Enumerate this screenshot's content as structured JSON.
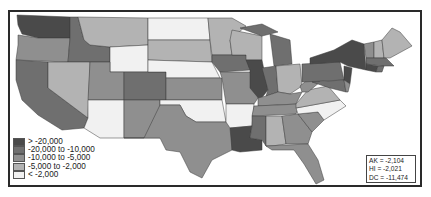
{
  "map": {
    "type": "choropleth",
    "region": "Contiguous United States",
    "colors": {
      "gt_20000": "#4a4a4a",
      "20000_to_10000": "#6f6f6f",
      "10000_to_5000": "#8f8f8f",
      "5000_to_2000": "#b3b3b3",
      "lt_2000": "#f1f1f1",
      "border": "#2a2a2a"
    }
  },
  "legend": {
    "items": [
      {
        "label": "> -20,000",
        "color": "#4a4a4a"
      },
      {
        "label": "-20,000 to -10,000",
        "color": "#6f6f6f"
      },
      {
        "label": "-10,000 to -5,000",
        "color": "#8f8f8f"
      },
      {
        "label": "-5,000 to -2,000",
        "color": "#b3b3b3"
      },
      {
        "label": "< -2,000",
        "color": "#f1f1f1"
      }
    ]
  },
  "insets": {
    "items": [
      {
        "label": "AK = -2,104"
      },
      {
        "label": "HI  = -2,021"
      },
      {
        "label": "DC = -11,474"
      }
    ]
  },
  "states": {
    "WA": "gt_20000",
    "OR": "10000_to_5000",
    "CA": "20000_to_10000",
    "ID": "20000_to_10000",
    "NV": "5000_to_2000",
    "MT": "5000_to_2000",
    "WY": "lt_2000",
    "UT": "10000_to_5000",
    "AZ": "lt_2000",
    "CO": "20000_to_10000",
    "NM": "10000_to_5000",
    "ND": "lt_2000",
    "SD": "5000_to_2000",
    "NE": "lt_2000",
    "KS": "10000_to_5000",
    "OK": "lt_2000",
    "TX": "10000_to_5000",
    "MN": "5000_to_2000",
    "IA": "20000_to_10000",
    "MO": "10000_to_5000",
    "AR": "lt_2000",
    "LA": "gt_20000",
    "WI": "5000_to_2000",
    "IL": "gt_20000",
    "MI": "20000_to_10000",
    "IN": "20000_to_10000",
    "OH": "5000_to_2000",
    "KY": "10000_to_5000",
    "TN": "10000_to_5000",
    "MS": "20000_to_10000",
    "AL": "5000_to_2000",
    "GA": "10000_to_5000",
    "FL": "10000_to_5000",
    "SC": "10000_to_5000",
    "NC": "lt_2000",
    "VA": "5000_to_2000",
    "WV": "10000_to_5000",
    "PA": "20000_to_10000",
    "NY": "gt_20000",
    "NJ": "gt_20000",
    "MD": "20000_to_10000",
    "DE": "10000_to_5000",
    "CT": "gt_20000",
    "RI": "20000_to_10000",
    "MA": "20000_to_10000",
    "VT": "10000_to_5000",
    "NH": "5000_to_2000",
    "ME": "5000_to_2000"
  }
}
